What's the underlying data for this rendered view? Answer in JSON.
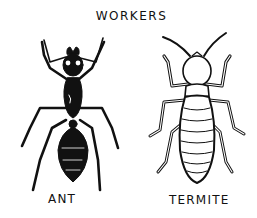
{
  "illustration": {
    "title": "WORKERS",
    "figures": [
      {
        "id": "ant",
        "label": "ANT",
        "style": "solid black ink silhouette"
      },
      {
        "id": "termite",
        "label": "TERMITE",
        "style": "outline ink drawing, segmented abdomen"
      }
    ],
    "colors": {
      "ink": "#111111",
      "background": "#ffffff"
    }
  }
}
